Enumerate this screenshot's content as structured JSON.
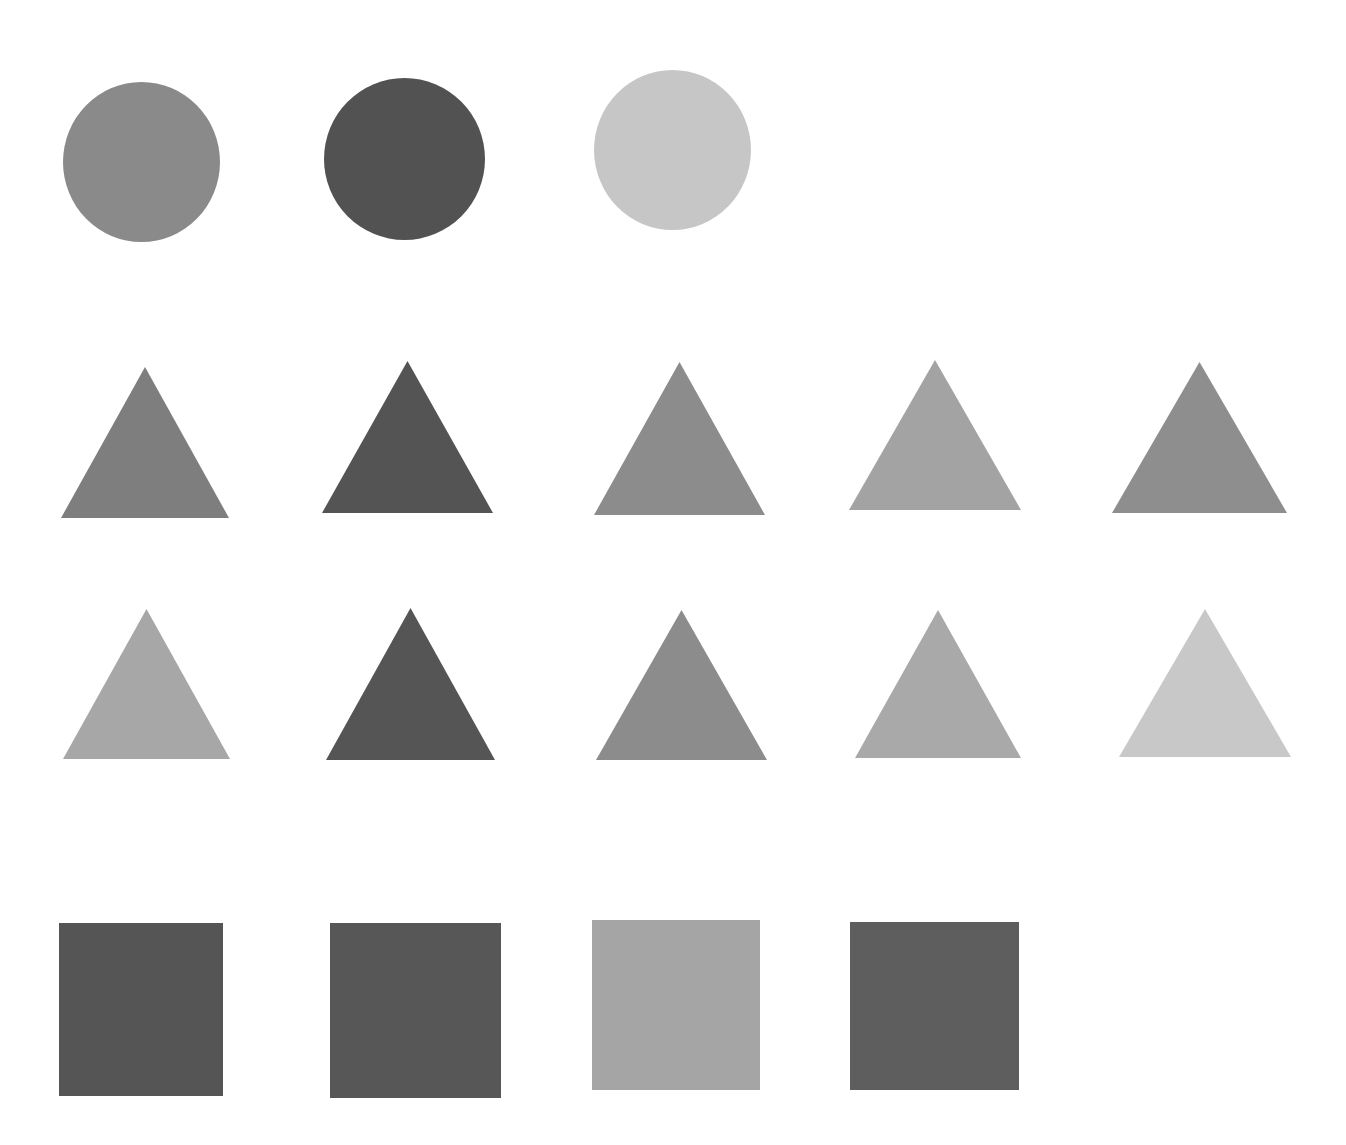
{
  "figure": {
    "background": "#ffffff",
    "rows": [
      {
        "name": "circles",
        "shapes": [
          {
            "type": "circle",
            "x": 63,
            "y": 82,
            "w": 157,
            "h": 160,
            "color": "#8a8a8a"
          },
          {
            "type": "circle",
            "x": 324,
            "y": 78,
            "w": 161,
            "h": 162,
            "color": "#525252"
          },
          {
            "type": "circle",
            "x": 594,
            "y": 70,
            "w": 157,
            "h": 160,
            "color": "#c6c6c6"
          }
        ]
      },
      {
        "name": "triangles-row-1",
        "shapes": [
          {
            "type": "triangle",
            "x": 61,
            "y": 367,
            "w": 168,
            "h": 151,
            "color": "#7e7e7e"
          },
          {
            "type": "triangle",
            "x": 322,
            "y": 361,
            "w": 171,
            "h": 152,
            "color": "#545454"
          },
          {
            "type": "triangle",
            "x": 594,
            "y": 362,
            "w": 171,
            "h": 153,
            "color": "#8c8c8c"
          },
          {
            "type": "triangle",
            "x": 849,
            "y": 360,
            "w": 172,
            "h": 150,
            "color": "#a3a3a3"
          },
          {
            "type": "triangle",
            "x": 1112,
            "y": 362,
            "w": 175,
            "h": 151,
            "color": "#8e8e8e"
          }
        ]
      },
      {
        "name": "triangles-row-2",
        "shapes": [
          {
            "type": "triangle",
            "x": 63,
            "y": 609,
            "w": 167,
            "h": 150,
            "color": "#a7a7a7"
          },
          {
            "type": "triangle",
            "x": 326,
            "y": 608,
            "w": 169,
            "h": 152,
            "color": "#555555"
          },
          {
            "type": "triangle",
            "x": 596,
            "y": 610,
            "w": 171,
            "h": 150,
            "color": "#8c8c8c"
          },
          {
            "type": "triangle",
            "x": 855,
            "y": 610,
            "w": 166,
            "h": 148,
            "color": "#a9a9a9"
          },
          {
            "type": "triangle",
            "x": 1119,
            "y": 609,
            "w": 172,
            "h": 148,
            "color": "#c8c8c8"
          }
        ]
      },
      {
        "name": "squares",
        "shapes": [
          {
            "type": "square",
            "x": 59,
            "y": 923,
            "w": 164,
            "h": 173,
            "color": "#555555"
          },
          {
            "type": "square",
            "x": 330,
            "y": 923,
            "w": 171,
            "h": 175,
            "color": "#575757"
          },
          {
            "type": "square",
            "x": 592,
            "y": 920,
            "w": 168,
            "h": 170,
            "color": "#a5a5a5"
          },
          {
            "type": "square",
            "x": 850,
            "y": 922,
            "w": 169,
            "h": 168,
            "color": "#5e5e5e"
          }
        ]
      }
    ]
  }
}
